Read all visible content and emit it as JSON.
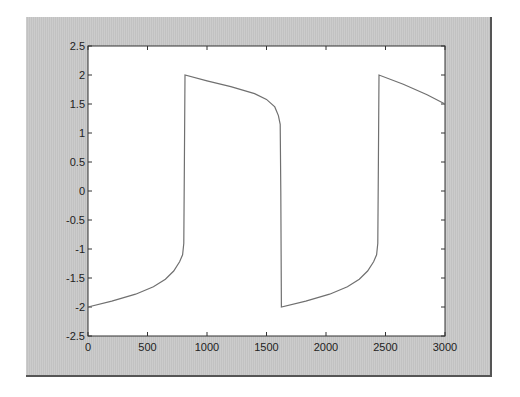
{
  "chart_data": {
    "type": "line",
    "title": "",
    "xlabel": "",
    "ylabel": "",
    "xlim": [
      0,
      3000
    ],
    "ylim": [
      -2.5,
      2.5
    ],
    "grid": false,
    "legend": null,
    "x_ticks": [
      "0",
      "500",
      "1000",
      "1500",
      "2000",
      "2500",
      "3000"
    ],
    "y_ticks": [
      "-2.5",
      "-2",
      "-1.5",
      "-1",
      "-0.5",
      "0",
      "0.5",
      "1",
      "1.5",
      "2",
      "2.5"
    ],
    "series": [
      {
        "name": "waveform",
        "color": "#707070",
        "x": [
          0,
          200,
          400,
          550,
          650,
          720,
          770,
          795,
          805,
          810,
          815,
          1000,
          1200,
          1400,
          1500,
          1570,
          1600,
          1615,
          1620,
          1625,
          1830,
          2030,
          2180,
          2280,
          2350,
          2400,
          2425,
          2435,
          2440,
          2445,
          2650,
          2850,
          3000
        ],
        "y": [
          -2.0,
          -1.9,
          -1.78,
          -1.65,
          -1.52,
          -1.38,
          -1.22,
          -1.1,
          -0.9,
          0.5,
          2.0,
          1.9,
          1.8,
          1.68,
          1.58,
          1.45,
          1.3,
          1.15,
          0.0,
          -2.0,
          -1.9,
          -1.78,
          -1.65,
          -1.52,
          -1.38,
          -1.22,
          -1.1,
          -0.9,
          0.5,
          2.0,
          1.84,
          1.66,
          1.5
        ]
      }
    ]
  },
  "axes": {
    "x_tick_labels": [
      "0",
      "500",
      "1000",
      "1500",
      "2000",
      "2500",
      "3000"
    ],
    "y_tick_labels": [
      "2.5",
      "2",
      "1.5",
      "1",
      "0.5",
      "0",
      "-0.5",
      "-1",
      "-1.5",
      "-2",
      "-2.5"
    ]
  }
}
